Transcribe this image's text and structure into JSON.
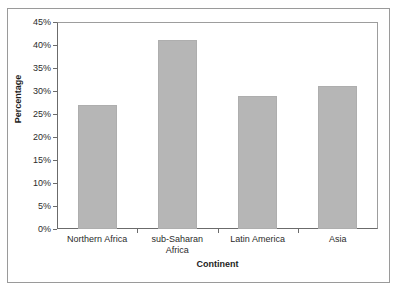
{
  "chart_data": {
    "type": "bar",
    "title": "",
    "subtitle": "",
    "xlabel": "Continent",
    "ylabel": "Percentage",
    "categories": [
      "Northern Africa",
      "sub-Saharan Africa",
      "Latin America",
      "Asia"
    ],
    "category_label_lines": [
      [
        "Northern Africa"
      ],
      [
        "sub-Saharan",
        "Africa"
      ],
      [
        "Latin America"
      ],
      [
        "Asia"
      ]
    ],
    "values": [
      27,
      41,
      29,
      31
    ],
    "value_labels": [
      "27%",
      "41%",
      "29%",
      "31%"
    ],
    "ylim": [
      0,
      45
    ],
    "ytick_values": [
      0,
      5,
      10,
      15,
      20,
      25,
      30,
      35,
      40,
      45
    ],
    "ytick_labels": [
      "0%",
      "5%",
      "10%",
      "15%",
      "20%",
      "25%",
      "30%",
      "35%",
      "40%",
      "45%"
    ],
    "grid": false,
    "legend": null,
    "bar_color": "#b6b6b6",
    "axis_color": "#6b6b6b",
    "frame_color": "#9a9a9a",
    "background": "#ffffff"
  }
}
